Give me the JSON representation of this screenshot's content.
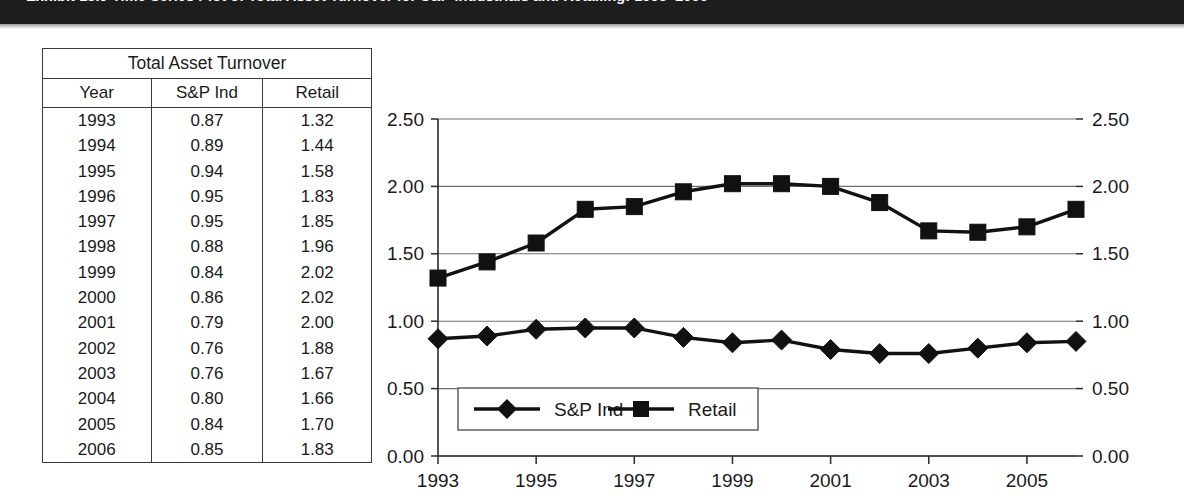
{
  "exhibit": {
    "title": "Exhibit 13.9   Time Series Plot of Total Asset Turnover for S&P Industrials and Retailing: 1993–2006"
  },
  "table": {
    "caption": "Total Asset Turnover",
    "columns": [
      "Year",
      "S&P Ind",
      "Retail"
    ],
    "rows": [
      [
        "1993",
        "0.87",
        "1.32"
      ],
      [
        "1994",
        "0.89",
        "1.44"
      ],
      [
        "1995",
        "0.94",
        "1.58"
      ],
      [
        "1996",
        "0.95",
        "1.83"
      ],
      [
        "1997",
        "0.95",
        "1.85"
      ],
      [
        "1998",
        "0.88",
        "1.96"
      ],
      [
        "1999",
        "0.84",
        "2.02"
      ],
      [
        "2000",
        "0.86",
        "2.02"
      ],
      [
        "2001",
        "0.79",
        "2.00"
      ],
      [
        "2002",
        "0.76",
        "1.88"
      ],
      [
        "2003",
        "0.76",
        "1.67"
      ],
      [
        "2004",
        "0.80",
        "1.66"
      ],
      [
        "2005",
        "0.84",
        "1.70"
      ],
      [
        "2006",
        "0.85",
        "1.83"
      ]
    ]
  },
  "chart_data": {
    "type": "line",
    "title": "",
    "xlabel": "",
    "ylabel": "",
    "x": [
      1993,
      1994,
      1995,
      1996,
      1997,
      1998,
      1999,
      2000,
      2001,
      2002,
      2003,
      2004,
      2005,
      2006
    ],
    "x_tick_labels": [
      "1993",
      "1995",
      "1997",
      "1999",
      "2001",
      "2003",
      "2005"
    ],
    "x_tick_values": [
      1993,
      1995,
      1997,
      1999,
      2001,
      2003,
      2005
    ],
    "ylim": [
      0.0,
      2.5
    ],
    "y_tick_labels": [
      "0.00",
      "0.50",
      "1.00",
      "1.50",
      "2.00",
      "2.50"
    ],
    "y_tick_values": [
      0.0,
      0.5,
      1.0,
      1.5,
      2.0,
      2.5
    ],
    "grid": true,
    "dual_y_axis": true,
    "legend_position": "bottom-left-inside",
    "series": [
      {
        "name": "S&P Ind",
        "marker": "diamond",
        "color": "#111111",
        "values": [
          0.87,
          0.89,
          0.94,
          0.95,
          0.95,
          0.88,
          0.84,
          0.86,
          0.79,
          0.76,
          0.76,
          0.8,
          0.84,
          0.85
        ]
      },
      {
        "name": "Retail",
        "marker": "square",
        "color": "#111111",
        "values": [
          1.32,
          1.44,
          1.58,
          1.83,
          1.85,
          1.96,
          2.02,
          2.02,
          2.0,
          1.88,
          1.67,
          1.66,
          1.7,
          1.83
        ]
      }
    ]
  }
}
